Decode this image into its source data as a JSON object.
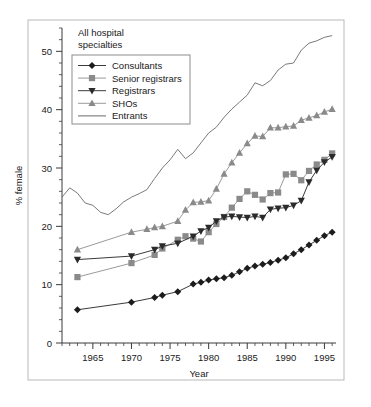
{
  "figure": {
    "panel_label_line1": "All hospital",
    "panel_label_line2": "specialties",
    "background": "#ffffff",
    "frame_color": "#b9b9b9"
  },
  "chart_data": {
    "type": "line",
    "xlabel": "Year",
    "ylabel": "% female",
    "xlim": [
      1961,
      1996.5
    ],
    "ylim": [
      0,
      54
    ],
    "xticks": [
      1965,
      1970,
      1975,
      1980,
      1985,
      1990,
      1995
    ],
    "xtick_labels": [
      "1965",
      "1970",
      "1975",
      "1980",
      "1985",
      "1990",
      "1995"
    ],
    "xminor_step": 1,
    "yticks": [
      0,
      10,
      20,
      30,
      40,
      50
    ],
    "ytick_labels": [
      "0",
      "10",
      "20",
      "30",
      "40",
      "50"
    ],
    "yminor_step": 2,
    "grid": false,
    "legend_position": "upper left",
    "series": [
      {
        "name": "Consultants",
        "marker": "diamond",
        "color": "#1c1c1c",
        "line_color": "#3a3a3a",
        "x": [
          1963,
          1970,
          1973,
          1974,
          1976,
          1978,
          1979,
          1980,
          1981,
          1982,
          1983,
          1984,
          1985,
          1986,
          1987,
          1988,
          1989,
          1990,
          1991,
          1992,
          1993,
          1994,
          1995,
          1996
        ],
        "y": [
          5.7,
          7.0,
          7.8,
          8.2,
          8.8,
          10.1,
          10.4,
          10.8,
          11.0,
          11.2,
          11.6,
          12.2,
          12.8,
          13.2,
          13.5,
          13.8,
          14.2,
          14.6,
          15.3,
          16.0,
          16.8,
          17.6,
          18.4,
          19.0
        ]
      },
      {
        "name": "Senior registrars",
        "marker": "square",
        "color": "#8a8a8a",
        "line_color": "#9a9a9a",
        "x": [
          1963,
          1970,
          1973,
          1974,
          1976,
          1977,
          1978,
          1979,
          1980,
          1981,
          1982,
          1983,
          1984,
          1985,
          1986,
          1987,
          1988,
          1989,
          1990,
          1991,
          1992,
          1993,
          1994,
          1995,
          1996
        ],
        "y": [
          11.3,
          13.7,
          15.1,
          16.2,
          17.7,
          18.3,
          17.9,
          17.4,
          19.0,
          20.4,
          21.6,
          23.2,
          24.7,
          26.0,
          25.4,
          24.6,
          25.7,
          25.8,
          28.9,
          29.0,
          27.9,
          29.5,
          30.6,
          31.4,
          32.5
        ]
      },
      {
        "name": "Registrars",
        "marker": "triangle-down",
        "color": "#2a2a2a",
        "line_color": "#3a3a3a",
        "x": [
          1963,
          1970,
          1973,
          1974,
          1976,
          1978,
          1979,
          1980,
          1981,
          1982,
          1983,
          1984,
          1985,
          1986,
          1987,
          1988,
          1989,
          1990,
          1991,
          1992,
          1993,
          1994,
          1995,
          1996
        ],
        "y": [
          14.3,
          14.9,
          16.0,
          16.6,
          17.1,
          18.3,
          19.2,
          19.8,
          20.9,
          21.6,
          21.7,
          21.6,
          21.5,
          21.7,
          21.5,
          22.9,
          23.1,
          23.2,
          23.6,
          24.4,
          27.6,
          29.6,
          31.0,
          31.9
        ]
      },
      {
        "name": "SHOs",
        "marker": "triangle-up",
        "color": "#8a8a8a",
        "line_color": "#9a9a9a",
        "x": [
          1963,
          1970,
          1972,
          1973,
          1974,
          1976,
          1977,
          1978,
          1979,
          1980,
          1981,
          1982,
          1983,
          1984,
          1985,
          1986,
          1987,
          1988,
          1989,
          1990,
          1991,
          1992,
          1993,
          1994,
          1995,
          1996
        ],
        "y": [
          16.0,
          19.0,
          19.5,
          19.8,
          20.0,
          20.9,
          22.8,
          24.1,
          24.2,
          24.4,
          26.4,
          29.0,
          30.9,
          32.6,
          34.2,
          35.5,
          35.4,
          36.9,
          36.9,
          37.1,
          37.2,
          38.2,
          38.6,
          39.0,
          39.6,
          40.1
        ]
      },
      {
        "name": "Entrants",
        "marker": "none",
        "color": "#6a6a6a",
        "line_color": "#6a6a6a",
        "x": [
          1961,
          1962,
          1963,
          1964,
          1965,
          1966,
          1967,
          1968,
          1969,
          1970,
          1971,
          1972,
          1973,
          1974,
          1975,
          1976,
          1977,
          1978,
          1979,
          1980,
          1981,
          1982,
          1983,
          1984,
          1985,
          1986,
          1987,
          1988,
          1989,
          1990,
          1991,
          1992,
          1993,
          1994,
          1995,
          1996
        ],
        "y": [
          25.0,
          26.6,
          25.7,
          24.0,
          23.6,
          22.4,
          22.0,
          23.0,
          24.2,
          25.0,
          25.6,
          26.3,
          28.2,
          30.0,
          31.4,
          33.2,
          31.6,
          32.6,
          34.3,
          36.0,
          37.0,
          38.7,
          40.1,
          41.3,
          42.5,
          44.6,
          44.1,
          45.0,
          46.8,
          47.8,
          48.0,
          50.2,
          51.4,
          51.8,
          52.4,
          52.7
        ]
      }
    ]
  }
}
